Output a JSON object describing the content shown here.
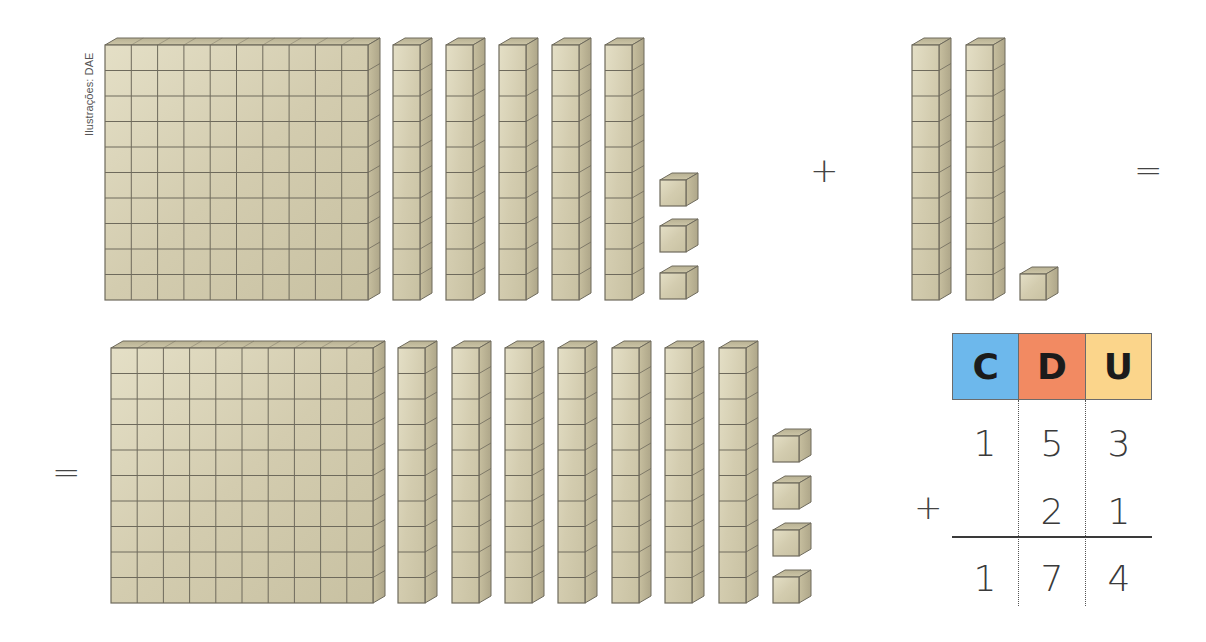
{
  "credit": "Ilustrações: DAE",
  "colors": {
    "block_face": "#d6d0b4",
    "block_face_light": "#e6e1c8",
    "block_side": "#bdb597",
    "block_top": "#c9c2a3",
    "block_edge": "#6e6a5c",
    "header_c": "#6db8ec",
    "header_d": "#f28a62",
    "header_u": "#fbd58b"
  },
  "operators": {
    "plus_top": "+",
    "equal_top": "=",
    "equal_bottom": "=",
    "plus_table": "+"
  },
  "equation": {
    "addend1": {
      "label": "153",
      "flats": [
        {
          "x": 105,
          "y": 45,
          "w": 263,
          "h": 255
        }
      ],
      "rods": [
        {
          "x": 393,
          "y": 45
        },
        {
          "x": 446,
          "y": 45
        },
        {
          "x": 499,
          "y": 45
        },
        {
          "x": 552,
          "y": 45
        },
        {
          "x": 605,
          "y": 45
        }
      ],
      "units": [
        {
          "x": 660,
          "y": 180
        },
        {
          "x": 660,
          "y": 226
        },
        {
          "x": 660,
          "y": 273
        }
      ]
    },
    "addend2": {
      "label": "21",
      "rods": [
        {
          "x": 912,
          "y": 45
        },
        {
          "x": 966,
          "y": 45
        }
      ],
      "units": [
        {
          "x": 1020,
          "y": 274
        }
      ]
    },
    "result": {
      "label": "174",
      "flats": [
        {
          "x": 111,
          "y": 348,
          "w": 262,
          "h": 255
        }
      ],
      "rods": [
        {
          "x": 398,
          "y": 348
        },
        {
          "x": 452,
          "y": 348
        },
        {
          "x": 505,
          "y": 348
        },
        {
          "x": 558,
          "y": 348
        },
        {
          "x": 612,
          "y": 348
        },
        {
          "x": 665,
          "y": 348
        },
        {
          "x": 719,
          "y": 348
        }
      ],
      "units": [
        {
          "x": 773,
          "y": 436
        },
        {
          "x": 773,
          "y": 483
        },
        {
          "x": 773,
          "y": 530
        },
        {
          "x": 773,
          "y": 577
        }
      ]
    }
  },
  "place_value_table": {
    "headers": [
      "C",
      "D",
      "U"
    ],
    "rows": [
      {
        "sign": "",
        "digits": [
          "1",
          "5",
          "3"
        ]
      },
      {
        "sign": "+",
        "digits": [
          "",
          "2",
          "1"
        ]
      },
      {
        "sign": "",
        "digits": [
          "1",
          "7",
          "4"
        ]
      }
    ]
  }
}
